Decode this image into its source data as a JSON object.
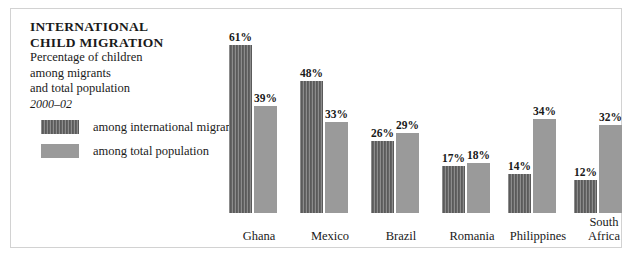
{
  "title": {
    "line1": "INTERNATIONAL",
    "line2": "CHILD MIGRATION"
  },
  "subtitle": {
    "line1": "Percentage of children",
    "line2": "among migrants",
    "line3": "and total population",
    "period": "2000–02"
  },
  "legend": {
    "items": [
      {
        "label": "among international migrants",
        "color": "#646464",
        "pattern": "vertical-stripes"
      },
      {
        "label": "among total population",
        "color": "#9a9a9a",
        "pattern": "solid"
      }
    ]
  },
  "colors": {
    "migrants": "#646464",
    "total": "#9a9a9a",
    "frame": "#d2d2d2",
    "background": "#ffffff",
    "text": "#1a1a1a"
  },
  "chart_data": {
    "type": "bar",
    "title": "INTERNATIONAL CHILD MIGRATION",
    "subtitle": "Percentage of children among migrants and total population 2000–02",
    "xlabel": "",
    "ylabel": "",
    "ylim": [
      0,
      61
    ],
    "grid": false,
    "legend_position": "upper-left",
    "unit": "%",
    "categories": [
      "Ghana",
      "Mexico",
      "Brazil",
      "Romania",
      "Philippines",
      "South Africa"
    ],
    "series": [
      {
        "name": "among international migrants",
        "color": "#646464",
        "values": [
          61,
          48,
          26,
          17,
          14,
          12
        ],
        "labels": [
          "61%",
          "48%",
          "26%",
          "17%",
          "14%",
          "12%"
        ]
      },
      {
        "name": "among total population",
        "color": "#9a9a9a",
        "values": [
          39,
          33,
          29,
          18,
          34,
          32
        ],
        "labels": [
          "39%",
          "33%",
          "29%",
          "18%",
          "34%",
          "32%"
        ]
      }
    ]
  },
  "groups": [
    {
      "name": "Ghana",
      "label_lines": [
        "Ghana"
      ],
      "migrants": {
        "value": 61,
        "label": "61%"
      },
      "total": {
        "value": 39,
        "label": "39%"
      }
    },
    {
      "name": "Mexico",
      "label_lines": [
        "Mexico"
      ],
      "migrants": {
        "value": 48,
        "label": "48%"
      },
      "total": {
        "value": 33,
        "label": "33%"
      }
    },
    {
      "name": "Brazil",
      "label_lines": [
        "Brazil"
      ],
      "migrants": {
        "value": 26,
        "label": "26%"
      },
      "total": {
        "value": 29,
        "label": "29%"
      }
    },
    {
      "name": "Romania",
      "label_lines": [
        "Romania"
      ],
      "migrants": {
        "value": 17,
        "label": "17%"
      },
      "total": {
        "value": 18,
        "label": "18%"
      }
    },
    {
      "name": "Philippines",
      "label_lines": [
        "Philippines"
      ],
      "migrants": {
        "value": 14,
        "label": "14%"
      },
      "total": {
        "value": 34,
        "label": "34%"
      }
    },
    {
      "name": "South Africa",
      "label_lines": [
        "South",
        "Africa"
      ],
      "migrants": {
        "value": 12,
        "label": "12%"
      },
      "total": {
        "value": 32,
        "label": "32%"
      }
    }
  ]
}
